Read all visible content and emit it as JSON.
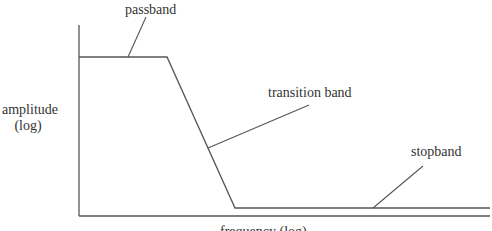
{
  "diagram": {
    "labels": {
      "passband": "passband",
      "transition_band": "transition band",
      "stopband": "stopband",
      "y_axis_line1": "amplitude",
      "y_axis_line2": "(log)",
      "x_axis": "frequency (log)"
    },
    "colors": {
      "line": "#555555",
      "text": "#333333",
      "background": "#ffffff"
    }
  }
}
